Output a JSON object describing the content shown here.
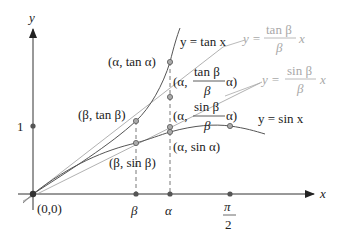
{
  "diagram": {
    "axes": {
      "x_label": "x",
      "y_label": "y",
      "origin_label": "(0,0)",
      "y_tick_label": "1",
      "x_ticks": [
        "β",
        "α",
        "π",
        "2"
      ]
    },
    "curves": {
      "tan": "y = tan x",
      "sin": "y = sin x",
      "tan_line": {
        "prefix": "y =",
        "num": "tan β",
        "den": "β",
        "suffix": "x"
      },
      "sin_line": {
        "prefix": "y =",
        "num": "sin β",
        "den": "β",
        "suffix": "x"
      }
    },
    "points": {
      "alpha_tan_alpha": "(α, tan α)",
      "beta_tan_beta": "(β, tan β)",
      "beta_sin_beta": "(β, sin β)",
      "alpha_sin_alpha": "(α, sin α)",
      "alpha_tanline": {
        "open": "(α,",
        "num": "tan β",
        "den": "β",
        "close": "α)"
      },
      "alpha_sinline": {
        "open": "(α,",
        "num": "sin β",
        "den": "β",
        "close": "α)"
      }
    },
    "colors": {
      "curve": "#555555",
      "line_light": "#a8a8a8",
      "axis": "#333333",
      "point_fill": "#999999"
    }
  }
}
